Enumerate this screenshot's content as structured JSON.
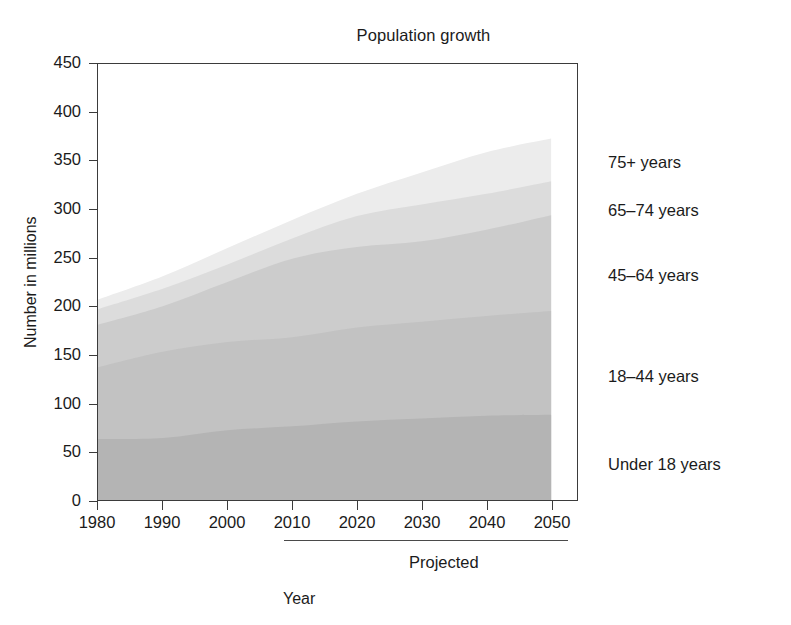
{
  "chart_data": {
    "type": "area",
    "title": "Population growth",
    "xlabel": "Year",
    "ylabel": "Number in millions",
    "grid": false,
    "legend_position": "right-inline",
    "xlim": [
      1980,
      2050
    ],
    "ylim": [
      0,
      450
    ],
    "ytick_step": 50,
    "xtick_labels": [
      "1980",
      "1990",
      "2000",
      "2010",
      "2020",
      "2030",
      "2040",
      "2050"
    ],
    "ytick_labels": [
      "0",
      "50",
      "100",
      "150",
      "200",
      "250",
      "300",
      "350",
      "400",
      "450"
    ],
    "x": [
      1980,
      1990,
      2000,
      2010,
      2020,
      2030,
      2040,
      2050
    ],
    "stacked": true,
    "annotations": [
      {
        "text": "Projected",
        "from_x": 2010,
        "to_x": 2050
      }
    ],
    "series": [
      {
        "name": "Under 18 years",
        "color": "#b4b4b4",
        "values": [
          63,
          64,
          72,
          76,
          81,
          84,
          87,
          88
        ]
      },
      {
        "name": "18–44 years",
        "color": "#c2c2c2",
        "values": [
          74,
          89,
          91,
          92,
          97,
          100,
          103,
          107
        ]
      },
      {
        "name": "45–64 years",
        "color": "#cccccc",
        "values": [
          44,
          47,
          62,
          81,
          83,
          83,
          89,
          99
        ]
      },
      {
        "name": "65–74 years",
        "color": "#dcdcdc",
        "values": [
          16,
          18,
          18,
          21,
          32,
          38,
          37,
          35
        ]
      },
      {
        "name": "75+ years",
        "color": "#ececec",
        "values": [
          10,
          13,
          17,
          19,
          23,
          33,
          43,
          44
        ]
      }
    ],
    "series_labels": [
      {
        "text": "75+ years",
        "y_frac": 0.775
      },
      {
        "text": "65–74 years",
        "y_frac": 0.665
      },
      {
        "text": "45–64 years",
        "y_frac": 0.515
      },
      {
        "text": "18–44 years",
        "y_frac": 0.285
      },
      {
        "text": "Under 18 years",
        "y_frac": 0.085
      }
    ]
  }
}
